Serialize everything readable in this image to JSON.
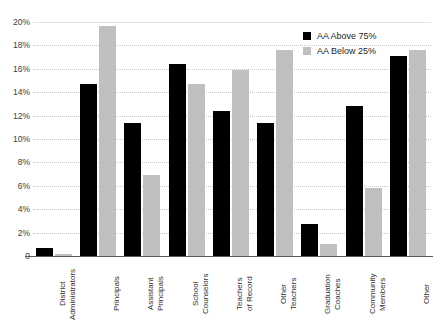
{
  "title": "",
  "legend": {
    "position": "top-right",
    "entries": [
      {
        "label": "AA Above 75%",
        "color": "#000000",
        "key": "above"
      },
      {
        "label": "AA Below 25%",
        "color": "#bfbfbf",
        "key": "below"
      }
    ]
  },
  "yaxis": {
    "ticks": [
      "20%",
      "18%",
      "16%",
      "14%",
      "12%",
      "10%",
      "8%",
      "6%",
      "4%",
      "2%",
      "0"
    ]
  },
  "chart_data": {
    "type": "bar",
    "title": "",
    "xlabel": "",
    "ylabel": "",
    "ylim": [
      0,
      20
    ],
    "ytick_step": 2,
    "grid": true,
    "legend_position": "top-right",
    "categories": [
      "District\nAdministrators",
      "Principals",
      "Assistant\nPrincipals",
      "School\nCounselors",
      "Teachers\nof Record",
      "Other\nTeachers",
      "Graduation\nCoaches",
      "Community\nMembers",
      "Other"
    ],
    "series": [
      {
        "name": "AA Above 75%",
        "color": "#000000",
        "values": [
          0.7,
          14.7,
          11.4,
          16.4,
          12.4,
          11.4,
          2.7,
          12.8,
          17.1
        ]
      },
      {
        "name": "AA Below 25%",
        "color": "#bfbfbf",
        "values": [
          0.2,
          19.7,
          6.9,
          14.7,
          15.9,
          17.6,
          1.0,
          5.8,
          17.6
        ]
      }
    ]
  }
}
